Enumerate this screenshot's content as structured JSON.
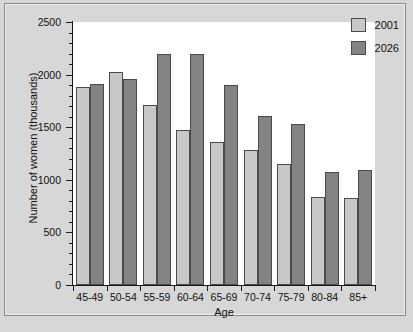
{
  "chart_data": {
    "type": "bar",
    "title": "",
    "subtitle": "",
    "xlabel": "Age",
    "ylabel": "Number of women (thousands)",
    "categories": [
      "45-49",
      "50-54",
      "55-59",
      "60-64",
      "65-69",
      "70-74",
      "75-79",
      "80-84",
      "85+"
    ],
    "series": [
      {
        "name": "2001",
        "color": "#c8c8c8",
        "values": [
          1880,
          2020,
          1710,
          1470,
          1360,
          1280,
          1150,
          840,
          830
        ]
      },
      {
        "name": "2026",
        "color": "#838383",
        "values": [
          1910,
          1960,
          2200,
          2200,
          1900,
          1610,
          1530,
          1070,
          1090
        ]
      }
    ],
    "ylim": [
      0,
      2500
    ],
    "ytick_labels": [
      "0",
      "500",
      "1000",
      "1500",
      "2000",
      "2500"
    ],
    "ytick_values": [
      0,
      500,
      1000,
      1500,
      2000,
      2500
    ],
    "yminor_step": 100,
    "grid": false,
    "legend_position": "top-right",
    "legend_entries": [
      "2001",
      "2026"
    ],
    "plot_background": "#ffffff",
    "figure_background": "#d7d7d7",
    "axis_color": "#1a1a1a"
  }
}
